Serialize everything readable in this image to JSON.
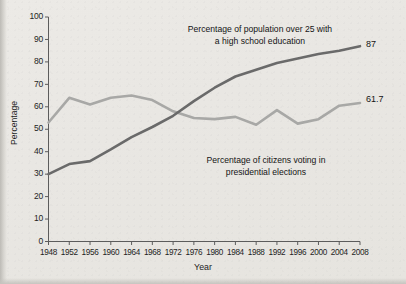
{
  "chart_data": {
    "type": "line",
    "title": "",
    "xlabel": "Year",
    "ylabel": "Percentage",
    "xlim": [
      1948,
      2008
    ],
    "ylim": [
      0,
      100
    ],
    "grid": false,
    "legend_position": "inline-annotations",
    "x": [
      1948,
      1952,
      1956,
      1960,
      1964,
      1968,
      1972,
      1976,
      1980,
      1984,
      1988,
      1992,
      1996,
      2000,
      2004,
      2008
    ],
    "xticks": [
      "1948",
      "1952",
      "1956",
      "1960",
      "1964",
      "1968",
      "1972",
      "1976",
      "1980",
      "1984",
      "1988",
      "1992",
      "1996",
      "2000",
      "2004",
      "2008"
    ],
    "yticks": [
      "0",
      "10",
      "20",
      "30",
      "40",
      "50",
      "60",
      "70",
      "80",
      "90",
      "100"
    ],
    "series": [
      {
        "name": "Percentage of population over 25 with a high school education",
        "color": "#6a6a6a",
        "end_label": "87",
        "values": [
          30,
          34.5,
          35.8,
          41,
          46.5,
          51,
          56,
          62.5,
          68.5,
          73.5,
          76.5,
          79.5,
          81.5,
          83.5,
          85,
          87
        ]
      },
      {
        "name": "Percentage of citizens voting in presidential elections",
        "color": "#a8a8a6",
        "end_label": "61.7",
        "values": [
          53,
          64,
          61,
          64,
          65,
          63,
          58,
          55,
          54.5,
          55.5,
          52,
          58.5,
          52.5,
          54.5,
          60.5,
          61.7
        ]
      }
    ],
    "annotations": [
      {
        "id": "education",
        "text": "Percentage of population over 25 with\na high school education"
      },
      {
        "id": "voting",
        "text": "Percentage of citizens voting in\npresidential elections"
      }
    ]
  },
  "axis": {
    "y_label": "Percentage",
    "x_label": "Year"
  }
}
